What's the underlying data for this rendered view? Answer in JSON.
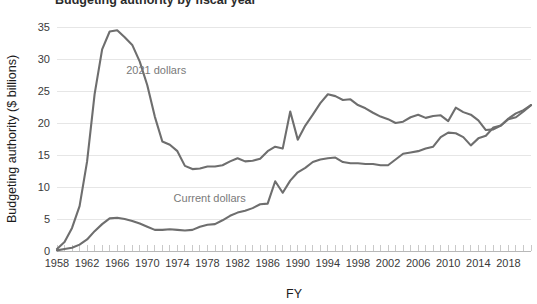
{
  "chart_data": {
    "type": "line",
    "title": "Budgeting authority by fiscal year",
    "xlabel": "FY",
    "ylabel": "Budgeting authority ($ billions)",
    "xlim": [
      1958,
      2021
    ],
    "ylim": [
      0,
      35
    ],
    "yticks": [
      0,
      5,
      10,
      15,
      20,
      25,
      30,
      35
    ],
    "xticks": [
      1958,
      1962,
      1966,
      1970,
      1974,
      1978,
      1982,
      1986,
      1990,
      1994,
      1998,
      2002,
      2006,
      2010,
      2014,
      2018
    ],
    "xtick_step": 4,
    "minor_tick_step": 1,
    "grid": true,
    "legend_position": "inline-annotations",
    "line_color": "#6e6e6e",
    "grid_color": "#e6e6e6",
    "x": [
      1958,
      1959,
      1960,
      1961,
      1962,
      1963,
      1964,
      1965,
      1966,
      1967,
      1968,
      1969,
      1970,
      1971,
      1972,
      1973,
      1974,
      1975,
      1976,
      1977,
      1978,
      1979,
      1980,
      1981,
      1982,
      1983,
      1984,
      1985,
      1986,
      1987,
      1988,
      1989,
      1990,
      1991,
      1992,
      1993,
      1994,
      1995,
      1996,
      1997,
      1998,
      1999,
      2000,
      2001,
      2002,
      2003,
      2004,
      2005,
      2006,
      2007,
      2008,
      2009,
      2010,
      2011,
      2012,
      2013,
      2014,
      2015,
      2016,
      2017,
      2018,
      2019,
      2020,
      2021
    ],
    "series": [
      {
        "name": "2021 dollars",
        "label": "2021 dollars",
        "label_x": 1967.2,
        "label_y": 27.6,
        "values": [
          0.3,
          1.4,
          3.6,
          7.0,
          14.0,
          24.5,
          31.5,
          34.3,
          34.5,
          33.4,
          32.2,
          29.6,
          25.9,
          21.0,
          17.1,
          16.6,
          15.6,
          13.3,
          12.8,
          12.9,
          13.2,
          13.2,
          13.4,
          14.0,
          14.5,
          14.0,
          14.1,
          14.4,
          15.6,
          16.3,
          16.0,
          21.8,
          17.4,
          19.6,
          21.3,
          23.1,
          24.5,
          24.2,
          23.6,
          23.7,
          22.8,
          22.3,
          21.6,
          21.0,
          20.6,
          20.0,
          20.2,
          20.9,
          21.3,
          20.8,
          21.1,
          21.2,
          20.3,
          22.4,
          21.7,
          21.3,
          20.4,
          18.9,
          19.0,
          19.6,
          20.6,
          20.9,
          21.8,
          22.8
        ]
      },
      {
        "name": "Current dollars",
        "label": "Current dollars",
        "label_x": 1973.5,
        "label_y": 7.7,
        "values": [
          0.1,
          0.3,
          0.5,
          1.0,
          1.8,
          3.1,
          4.2,
          5.1,
          5.2,
          5.0,
          4.7,
          4.3,
          3.8,
          3.3,
          3.3,
          3.4,
          3.3,
          3.2,
          3.3,
          3.8,
          4.1,
          4.2,
          4.8,
          5.5,
          6.0,
          6.3,
          6.7,
          7.3,
          7.4,
          10.9,
          9.1,
          11.0,
          12.3,
          13.0,
          13.9,
          14.3,
          14.5,
          14.6,
          13.9,
          13.7,
          13.7,
          13.6,
          13.6,
          13.4,
          13.4,
          14.3,
          15.2,
          15.4,
          15.6,
          16.0,
          16.3,
          17.8,
          18.5,
          18.4,
          17.8,
          16.5,
          17.6,
          18.0,
          19.3,
          19.6,
          20.7,
          21.5,
          22.0,
          22.8
        ]
      }
    ]
  }
}
